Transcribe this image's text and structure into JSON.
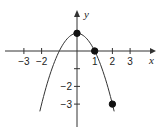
{
  "chart_data": {
    "type": "line",
    "title": "",
    "xlabel": "x",
    "ylabel": "y",
    "function": "y = 1 - x^2",
    "xlim": [
      -3.5,
      3.6
    ],
    "ylim": [
      -4.0,
      2.7
    ],
    "x_ticks": [
      -3,
      -2,
      1,
      2,
      3
    ],
    "x_tick_labels": [
      "−3",
      "−2",
      "1",
      "2",
      "3"
    ],
    "y_ticks": [
      1,
      -1,
      -2,
      -3
    ],
    "y_tick_labels": [
      "",
      "",
      "−2",
      "−3"
    ],
    "curve_domain": [
      -2.1,
      2.1
    ],
    "series": [
      {
        "name": "parabola",
        "x": [
          -2.1,
          -1.5,
          -1,
          0,
          1,
          1.5,
          2
        ],
        "values": [
          -3.41,
          -1.25,
          0,
          1,
          0,
          -1.25,
          -3
        ]
      }
    ],
    "points": [
      {
        "x": 0,
        "y": 1,
        "filled": true
      },
      {
        "x": 1,
        "y": 0,
        "filled": true
      },
      {
        "x": 2,
        "y": -3,
        "filled": true
      }
    ],
    "grid": false,
    "legend": null
  }
}
